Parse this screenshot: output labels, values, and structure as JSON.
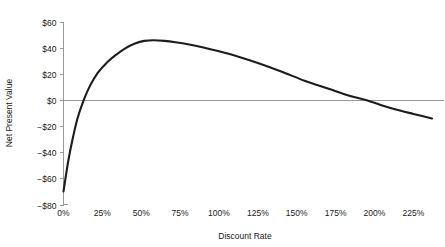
{
  "chart_data": {
    "type": "line",
    "title": "",
    "subtitle": "",
    "xlabel": "Discount Rate",
    "ylabel": "Net Present Value",
    "xlim": [
      0,
      237
    ],
    "ylim": [
      -80,
      60
    ],
    "grid": false,
    "legend": null,
    "legend_position": "none",
    "x_tick_labels": [
      "0%",
      "25%",
      "50%",
      "75%",
      "100%",
      "125%",
      "150%",
      "175%",
      "200%",
      "225%"
    ],
    "x_tick_values": [
      0,
      25,
      50,
      75,
      100,
      125,
      150,
      175,
      200,
      225
    ],
    "y_tick_labels": [
      "$60",
      "$40",
      "$20",
      "$0",
      "−$20",
      "−$40",
      "−$60",
      "−$80"
    ],
    "y_tick_values": [
      60,
      40,
      20,
      0,
      -20,
      -40,
      -60,
      -80
    ],
    "series": [
      {
        "name": "Net Present Value",
        "color": "#1c1c1c",
        "x": [
          0,
          3,
          6,
          9,
          13,
          17,
          22,
          28,
          34,
          40,
          46,
          52,
          58,
          65,
          72,
          80,
          90,
          100,
          112,
          125,
          140,
          155,
          170,
          185,
          195,
          205,
          215,
          225,
          237
        ],
        "values": [
          -70,
          -47,
          -29,
          -14,
          0,
          11,
          21,
          29,
          35,
          40,
          43.5,
          45.5,
          46,
          45.5,
          44.5,
          43,
          40.5,
          37.5,
          33.5,
          28.5,
          22,
          15,
          9,
          3,
          0,
          -4,
          -7.5,
          -10.5,
          -14
        ]
      }
    ],
    "annotations": {
      "zero_crossings": [
        13,
        195
      ],
      "peak": {
        "x": 58,
        "y": 46
      }
    }
  },
  "axes": {
    "x_axis_name": "discount-rate-axis",
    "y_axis_name": "net-present-value-axis"
  }
}
